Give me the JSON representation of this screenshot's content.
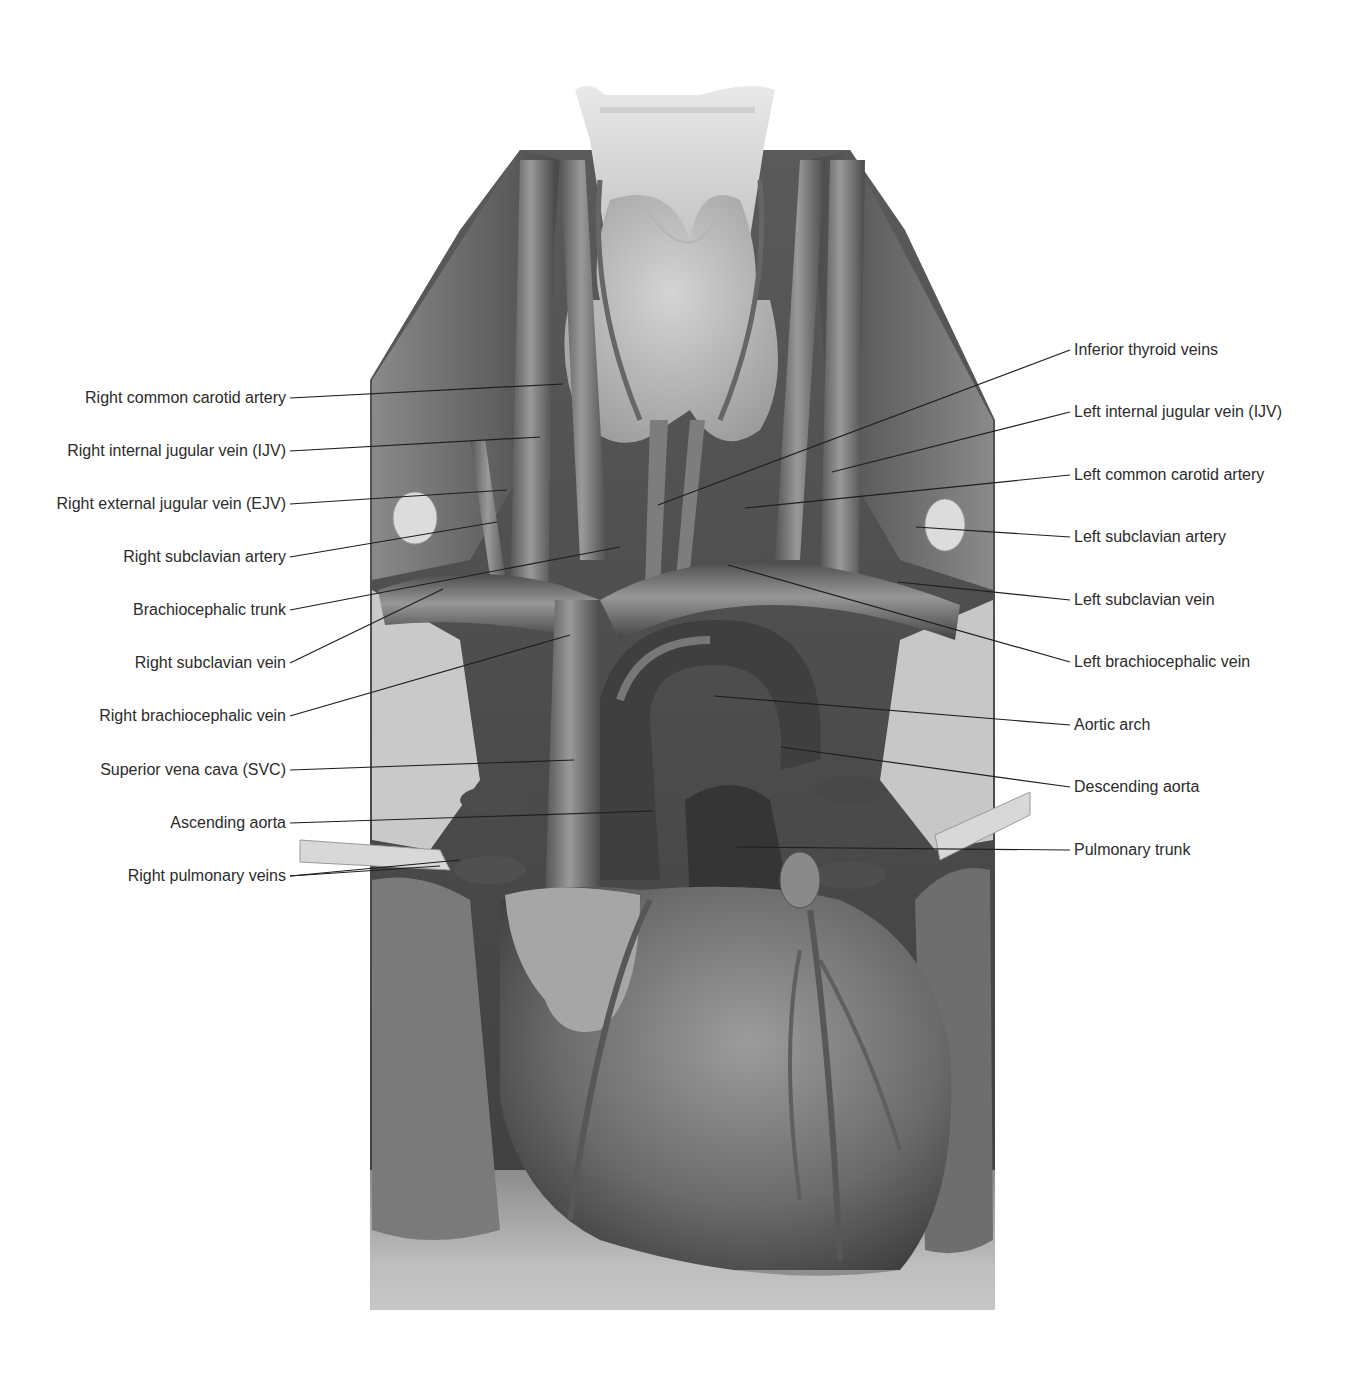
{
  "figure": {
    "colors": {
      "background": "#ffffff",
      "label_text": "#2b2b2b",
      "leader_line": "#1e1e1e",
      "tissue_light": "#d9d9d9",
      "tissue_mid": "#8f8f8f",
      "tissue_dark": "#3c3c3c",
      "vessel": "#6e6e6e"
    }
  },
  "labels": {
    "left": [
      {
        "text": "Right common carotid artery",
        "y": 398,
        "target": [
          563,
          384
        ]
      },
      {
        "text": "Right internal jugular vein (IJV)",
        "y": 451,
        "target": [
          540,
          437
        ]
      },
      {
        "text": "Right external jugular vein (EJV)",
        "y": 504,
        "target": [
          507,
          490
        ]
      },
      {
        "text": "Right subclavian artery",
        "y": 557,
        "target": [
          497,
          522
        ]
      },
      {
        "text": "Brachiocephalic trunk",
        "y": 610,
        "target": [
          620,
          547
        ]
      },
      {
        "text": "Right subclavian vein",
        "y": 663,
        "target": [
          443,
          589
        ]
      },
      {
        "text": "Right brachiocephalic vein",
        "y": 716,
        "target": [
          570,
          635
        ]
      },
      {
        "text": "Superior vena cava (SVC)",
        "y": 770,
        "target": [
          574,
          760
        ]
      },
      {
        "text": "Ascending aorta",
        "y": 823,
        "target": [
          653,
          811
        ]
      },
      {
        "text": "Right pulmonary veins",
        "y": 876,
        "target": [
          [
            460,
            860
          ],
          [
            440,
            866
          ]
        ]
      }
    ],
    "right": [
      {
        "text": "Inferior thyroid veins",
        "y": 350,
        "target": [
          658,
          505
        ]
      },
      {
        "text": "Left internal jugular vein (IJV)",
        "y": 412,
        "target": [
          832,
          472
        ]
      },
      {
        "text": "Left common carotid artery",
        "y": 475,
        "target": [
          745,
          508
        ]
      },
      {
        "text": "Left subclavian artery",
        "y": 537,
        "target": [
          916,
          527
        ]
      },
      {
        "text": "Left subclavian vein",
        "y": 600,
        "target": [
          898,
          582
        ]
      },
      {
        "text": "Left brachiocephalic vein",
        "y": 662,
        "target": [
          728,
          565
        ]
      },
      {
        "text": "Aortic arch",
        "y": 725,
        "target": [
          714,
          696
        ]
      },
      {
        "text": "Descending aorta",
        "y": 787,
        "target": [
          781,
          747
        ]
      },
      {
        "text": "Pulmonary trunk",
        "y": 850,
        "target": [
          737,
          847
        ]
      }
    ]
  }
}
